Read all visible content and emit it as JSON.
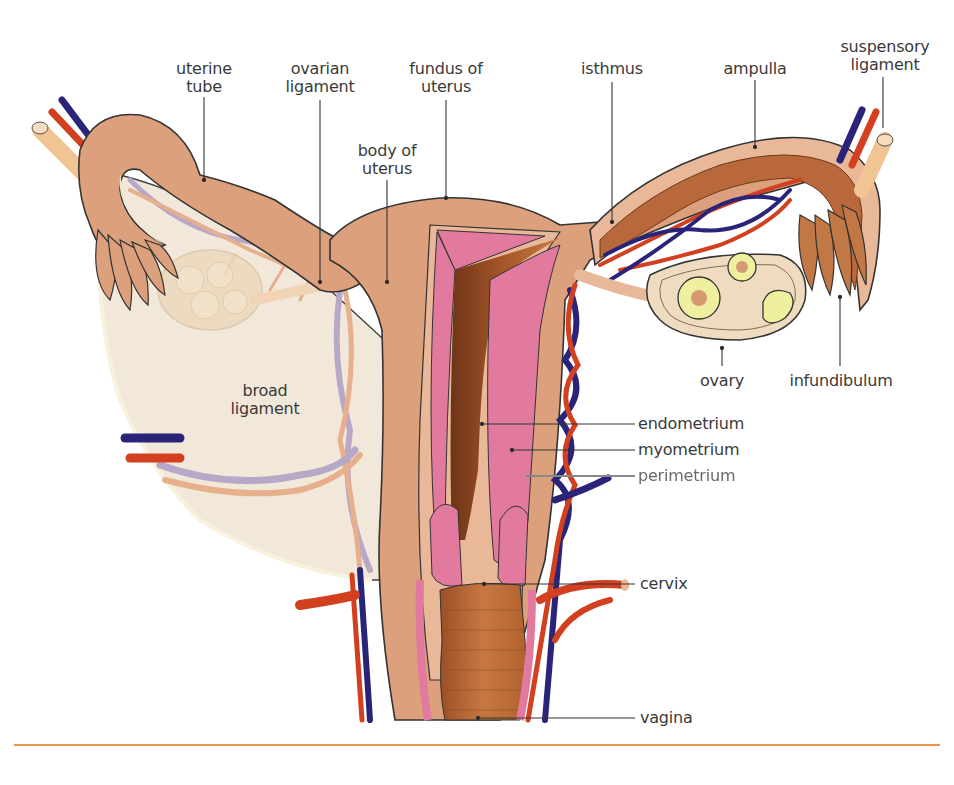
{
  "diagram": {
    "labels": {
      "uterine_tube": "uterine\ntube",
      "ovarian_ligament": "ovarian\nligament",
      "fundus_of_uterus": "fundus of\nuterus",
      "body_of_uterus": "body of\nuterus",
      "isthmus": "isthmus",
      "ampulla": "ampulla",
      "suspensory_ligament": "suspensory\nligament",
      "broad_ligament": "broad\nligament",
      "ovary": "ovary",
      "infundibulum": "infundibulum",
      "endometrium": "endometrium",
      "myometrium": "myometrium",
      "perimetrium": "perimetrium",
      "cervix": "cervix",
      "vagina": "vagina"
    },
    "colors": {
      "tissue": "#dca07c",
      "tissue_light": "#e8b898",
      "endometrium_pink": "#e27aa0",
      "lumen_brown": "#b8683a",
      "lumen_dark": "#7a3a1c",
      "broad_ligament": "#f2e8da",
      "ovary": "#efdcc0",
      "follicle": "#eef0a0",
      "artery": "#d2401f",
      "vein": "#2a2478",
      "ligament_tube": "#f0c493",
      "rule": "#e8954a",
      "leader_line": "#333333"
    }
  }
}
